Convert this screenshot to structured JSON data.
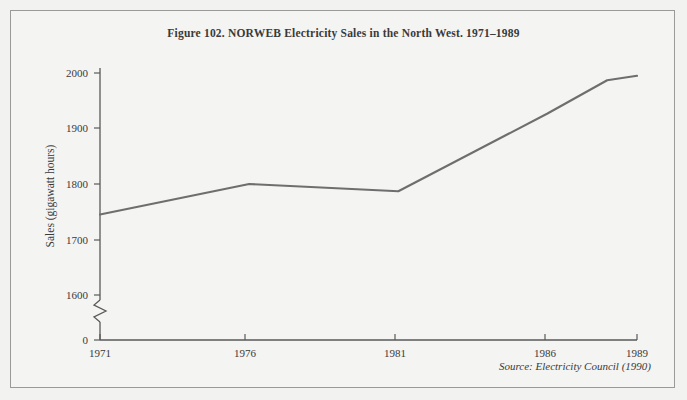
{
  "figure": {
    "title": "Figure 102.  NORWEB Electricity Sales in the North West. 1971–1989",
    "source_note": "Source: Electricity Council (1990)",
    "background_color": "#f4f4f2",
    "frame_color": "#9a9a99",
    "line_color": "#6e6e6e",
    "axis_color": "#595959",
    "text_color": "#3a3a3a"
  },
  "chart_data": {
    "type": "line",
    "title": "Figure 102.  NORWEB Electricity Sales in the North West. 1971–1989",
    "xlabel": "",
    "ylabel": "Sales (gigawatt hours)",
    "xlim": [
      1971,
      1989
    ],
    "ylim": [
      1550,
      2030
    ],
    "y_axis_break": true,
    "y_break_note": "axis broken between 0 and 1600",
    "grid": false,
    "legend": null,
    "xticks": [
      1971,
      1976,
      1981,
      1986,
      1989
    ],
    "xtick_labels": [
      "1971",
      "1976",
      "1981",
      "1986",
      "1989"
    ],
    "yticks": [
      0,
      1600,
      1700,
      1800,
      1900,
      2000
    ],
    "ytick_labels": [
      "0",
      "1600",
      "1700",
      "1800",
      "1900",
      "2000"
    ],
    "x": [
      1971,
      1972,
      1973,
      1974,
      1975,
      1976,
      1977,
      1978,
      1979,
      1980,
      1981,
      1982,
      1983,
      1984,
      1985,
      1986,
      1987,
      1988,
      1989
    ],
    "values": [
      1745,
      1756,
      1767,
      1778,
      1789,
      1800,
      1797,
      1795,
      1793,
      1790,
      1787,
      1815,
      1843,
      1871,
      1899,
      1927,
      1958,
      1987,
      1995
    ],
    "series": [
      {
        "name": "NORWEB Electricity Sales",
        "units": "gigawatt hours",
        "values": [
          1745,
          1756,
          1767,
          1778,
          1789,
          1800,
          1797,
          1795,
          1793,
          1790,
          1787,
          1815,
          1843,
          1871,
          1899,
          1927,
          1958,
          1987,
          1995
        ]
      }
    ],
    "vertices": [
      {
        "year": 1971,
        "value": 1745
      },
      {
        "year": 1976,
        "value": 1800
      },
      {
        "year": 1981,
        "value": 1787
      },
      {
        "year": 1986,
        "value": 1927
      },
      {
        "year": 1988,
        "value": 1987
      },
      {
        "year": 1989,
        "value": 1995
      }
    ]
  }
}
